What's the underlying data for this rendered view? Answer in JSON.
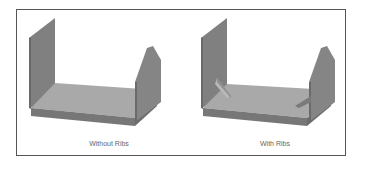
{
  "figures": [
    {
      "id": "without-ribs",
      "caption": "Without Ribs",
      "has_ribs": false
    },
    {
      "id": "with-ribs",
      "caption": "With Ribs",
      "has_ribs": true
    }
  ],
  "colors": {
    "frame": "#555555",
    "panel_face": "#8a8a8a",
    "panel_dark": "#6f6f6f",
    "base_top": "#a8a8a8",
    "base_front": "#7a7a7a",
    "rib": "#b5b5b5",
    "caption": "#666666"
  }
}
